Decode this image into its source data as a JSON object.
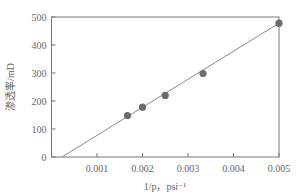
{
  "chart_data": {
    "type": "scatter",
    "title": "",
    "xlabel": "1/p，psi⁻¹",
    "ylabel": "渗透率/mD",
    "xlim": [
      0,
      0.005
    ],
    "ylim": [
      0,
      500
    ],
    "x_ticks": [
      "0.001",
      "0.002",
      "0.003",
      "0.004",
      "0.005"
    ],
    "y_ticks": [
      "0",
      "100",
      "200",
      "300",
      "400",
      "500"
    ],
    "grid": false,
    "legend": null,
    "series": [
      {
        "name": "measured",
        "kind": "scatter",
        "x": [
          0.00167,
          0.002,
          0.0025,
          0.00333,
          0.005
        ],
        "y": [
          148,
          178,
          220,
          298,
          478
        ]
      },
      {
        "name": "linear fit",
        "kind": "line",
        "x": [
          0.00023,
          0.005
        ],
        "y": [
          0,
          478
        ]
      }
    ],
    "colors": {
      "marker": "#6b6b6b",
      "line": "#8a8a8a",
      "axis": "#777777"
    }
  }
}
